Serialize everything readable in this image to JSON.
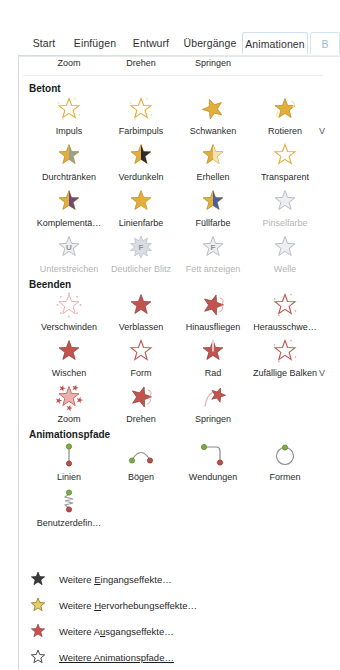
{
  "window": {
    "app": "PowerPoint",
    "ribbon_tabs": [
      {
        "label": "Start",
        "active": false,
        "x": 22,
        "w": 44
      },
      {
        "label": "Einfügen",
        "active": false,
        "x": 66,
        "w": 58
      },
      {
        "label": "Entwurf",
        "active": false,
        "x": 124,
        "w": 54
      },
      {
        "label": "Übergänge",
        "active": false,
        "x": 178,
        "w": 64
      },
      {
        "label": "Animationen",
        "active": true,
        "x": 242,
        "w": 66
      },
      {
        "label": "B",
        "active": false,
        "x": 310,
        "w": 30,
        "cut": true
      }
    ]
  },
  "gallery": {
    "top_row": {
      "note": "bottom row of Eingang (entrance) section, icons cut off above panel",
      "items": [
        {
          "label": "Zoom",
          "x": 14,
          "icon": "star-entrance"
        },
        {
          "label": "Drehen",
          "x": 86,
          "icon": "star-entrance"
        },
        {
          "label": "Springen",
          "x": 158,
          "icon": "star-entrance"
        }
      ]
    },
    "sections": [
      {
        "id": "betont",
        "title": "Betont",
        "title_y": 26,
        "color": "#e8b23a",
        "rows": [
          {
            "y": 38,
            "overflow_marker": "V",
            "items": [
              {
                "label": "Impuls",
                "icon": "star-pulse",
                "disabled": false
              },
              {
                "label": "Farbimpuls",
                "icon": "star-colorpulse",
                "disabled": false
              },
              {
                "label": "Schwanken",
                "icon": "star-teeter",
                "disabled": false
              },
              {
                "label": "Rotieren",
                "icon": "star-spin",
                "disabled": false
              }
            ]
          },
          {
            "y": 84,
            "items": [
              {
                "label": "Durchtränken",
                "icon": "star-desaturate",
                "disabled": false
              },
              {
                "label": "Verdunkeln",
                "icon": "star-darken",
                "disabled": false
              },
              {
                "label": "Erhellen",
                "icon": "star-lighten",
                "disabled": false
              },
              {
                "label": "Transparent",
                "icon": "star-transparency",
                "disabled": false
              }
            ]
          },
          {
            "y": 130,
            "items": [
              {
                "label": "Komplementä…",
                "icon": "star-complementary",
                "disabled": false
              },
              {
                "label": "Linienfarbe",
                "icon": "star-linecolor",
                "disabled": false
              },
              {
                "label": "Füllfarbe",
                "icon": "star-fillcolor",
                "disabled": false
              },
              {
                "label": "Pinselfarbe",
                "icon": "star-brushcolor",
                "disabled": true
              }
            ]
          },
          {
            "y": 176,
            "items": [
              {
                "label": "Unterstreichen",
                "icon": "star-underline",
                "disabled": true,
                "glyph": "U"
              },
              {
                "label": "Deutlicher Blitz",
                "icon": "star-boldflash",
                "disabled": true,
                "glyph": "F"
              },
              {
                "label": "Fett anzeigen",
                "icon": "star-boldreveal",
                "disabled": true,
                "glyph": "F"
              },
              {
                "label": "Welle",
                "icon": "star-wave",
                "disabled": true
              }
            ]
          }
        ]
      },
      {
        "id": "beenden",
        "title": "Beenden",
        "title_y": 222,
        "color": "#c0504d",
        "rows": [
          {
            "y": 234,
            "items": [
              {
                "label": "Verschwinden",
                "icon": "star-disappear-exit"
              },
              {
                "label": "Verblassen",
                "icon": "star-fade-exit"
              },
              {
                "label": "Hinausfliegen",
                "icon": "star-flyout-exit"
              },
              {
                "label": "Herausschwe…",
                "icon": "star-floatout-exit"
              }
            ]
          },
          {
            "y": 280,
            "overflow_marker": "V",
            "items": [
              {
                "label": "Wischen",
                "icon": "star-wipe-exit"
              },
              {
                "label": "Form",
                "icon": "star-shape-exit"
              },
              {
                "label": "Rad",
                "icon": "star-wheel-exit"
              },
              {
                "label": "Zufällige Balken",
                "icon": "star-randombars-exit"
              }
            ]
          },
          {
            "y": 326,
            "items": [
              {
                "label": "Zoom",
                "icon": "star-zoom-exit"
              },
              {
                "label": "Drehen",
                "icon": "star-spin-exit"
              },
              {
                "label": "Springen",
                "icon": "star-bounce-exit"
              }
            ]
          }
        ]
      },
      {
        "id": "animationspfade",
        "title": "Animationspfade",
        "title_y": 372,
        "color": "#7aa63f",
        "rows": [
          {
            "y": 384,
            "items": [
              {
                "label": "Linien",
                "icon": "path-line"
              },
              {
                "label": "Bögen",
                "icon": "path-arc"
              },
              {
                "label": "Wendungen",
                "icon": "path-turn"
              },
              {
                "label": "Formen",
                "icon": "path-shape"
              }
            ]
          },
          {
            "y": 430,
            "items": [
              {
                "label": "Benutzerdefin…",
                "icon": "path-custom"
              }
            ]
          }
        ]
      }
    ]
  },
  "menu": {
    "y_start": 511,
    "row_height": 26,
    "items": [
      {
        "label_pre": "Weitere ",
        "accel": "E",
        "label_post": "ingangseffekte…",
        "icon": "star-entrance-dark"
      },
      {
        "label_pre": "Weitere ",
        "accel": "H",
        "label_post": "ervorhebungseffekte…",
        "icon": "star-emphasis-gold"
      },
      {
        "label_pre": "Weitere A",
        "accel": "u",
        "label_post": "sgangseffekte…",
        "icon": "star-exit-red"
      },
      {
        "label_pre": "",
        "accel": "W",
        "label_post": "eitere Animationspfade…",
        "icon": "star-path-outline",
        "full_underline": true
      }
    ]
  },
  "colors": {
    "emphasis_gold": "#e3ae3b",
    "emphasis_gold_light": "#f6e2a8",
    "exit_red": "#c2534f",
    "exit_red_light": "#e8b2ae",
    "path_green": "#7faa45",
    "path_red": "#b5504c",
    "disabled_gray": "#b9bec4",
    "tab_active_border": "#cfdff0"
  }
}
